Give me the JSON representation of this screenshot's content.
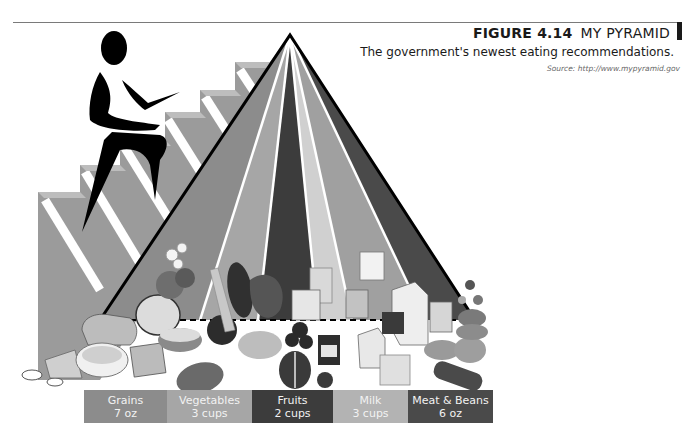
{
  "figure": {
    "number": "FIGURE 4.14",
    "title": "MY PYRAMID",
    "subtitle": "The government's newest eating recommendations.",
    "source": "Source: http://www.mypyramid.gov"
  },
  "illustration": {
    "figure_icon": "stair-climbing-person-icon",
    "stairs_icon": "staircase-icon",
    "pyramid_icon": "food-pyramid-icon",
    "food_icons": [
      "bread-icon",
      "cereal-bowl-icon",
      "pasta-icon",
      "crackers-icon",
      "broccoli-icon",
      "carrot-icon",
      "sweet-potato-icon",
      "grapes-icon",
      "apple-icon",
      "peaches-can-icon",
      "raisins-box-icon",
      "milk-carton-icon",
      "yogurt-icon",
      "cheese-icon",
      "fish-icon",
      "beans-icon",
      "nuts-icon",
      "meat-icon"
    ]
  },
  "food_groups": [
    {
      "name": "Grains",
      "amount": "7 oz",
      "color": "#8c8c8c"
    },
    {
      "name": "Vegetables",
      "amount": "3 cups",
      "color": "#a6a6a6"
    },
    {
      "name": "Fruits",
      "amount": "2 cups",
      "color": "#3c3c3c"
    },
    {
      "name": "Milk",
      "amount": "3 cups",
      "color": "#b3b3b3"
    },
    {
      "name": "Meat & Beans",
      "amount": "6 oz",
      "color": "#4a4a4a"
    }
  ]
}
